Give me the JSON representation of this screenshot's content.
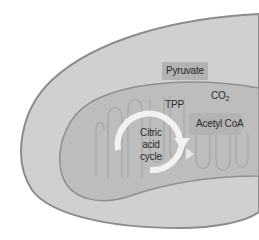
{
  "diagram": {
    "type": "mitochondrion-cross-section",
    "labels": {
      "pyruvate": "Pyruvate",
      "tpp": "TPP",
      "co2_base": "CO",
      "co2_sub": "2",
      "acetyl_coa": "Acetyl CoA",
      "citric_acid_cycle": "Citric\nacid\ncycle"
    },
    "colors": {
      "background": "#ffffff",
      "outer_membrane_fill": "#d0d0d0",
      "outer_membrane_stroke": "#8c8c8c",
      "matrix_fill": "#bdbdbd",
      "matrix_stroke": "#8f8f8f",
      "cristae_stroke": "#a5a5a5",
      "label_box": "#b3b3b3",
      "cycle_arrow": "#f2f2f2",
      "text": "#2a2a2a"
    }
  }
}
